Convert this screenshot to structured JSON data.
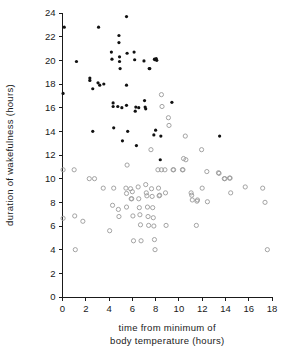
{
  "chart_data": {
    "type": "scatter",
    "title": "",
    "xlabel": "time from minimum of body temperature (hours)",
    "xlabel_lines": [
      "time from minimum of",
      "body temperature (hours)"
    ],
    "ylabel": "duration of wakefulness (hours)",
    "xlim": [
      0,
      18
    ],
    "ylim": [
      0,
      24
    ],
    "xticks": [
      0,
      2,
      4,
      6,
      8,
      10,
      12,
      14,
      16,
      18
    ],
    "yticks": [
      0,
      2,
      4,
      6,
      8,
      10,
      12,
      14,
      16,
      18,
      20,
      22,
      24
    ],
    "grid": false,
    "legend": "none",
    "series": [
      {
        "name": "filled-circles",
        "marker": "filled circle",
        "color": "#111111",
        "points": [
          [
            0.15,
            22.8
          ],
          [
            0.05,
            17.2
          ],
          [
            1.2,
            19.9
          ],
          [
            2.35,
            18.5
          ],
          [
            2.35,
            18.3
          ],
          [
            2.6,
            17.6
          ],
          [
            2.6,
            14.0
          ],
          [
            3.1,
            22.8
          ],
          [
            3.05,
            18.1
          ],
          [
            3.2,
            17.9
          ],
          [
            3.55,
            18.0
          ],
          [
            4.2,
            20.7
          ],
          [
            4.25,
            20.1
          ],
          [
            4.35,
            16.1
          ],
          [
            4.35,
            16.4
          ],
          [
            4.4,
            14.3
          ],
          [
            4.85,
            21.5
          ],
          [
            4.85,
            22.1
          ],
          [
            4.9,
            20.3
          ],
          [
            4.9,
            19.9
          ],
          [
            4.95,
            19.3
          ],
          [
            4.75,
            16.1
          ],
          [
            5.1,
            16.0
          ],
          [
            5.15,
            13.2
          ],
          [
            5.5,
            23.7
          ],
          [
            5.55,
            20.6
          ],
          [
            5.5,
            17.9
          ],
          [
            5.5,
            16.2
          ],
          [
            5.6,
            14.0
          ],
          [
            6.15,
            20.7
          ],
          [
            6.2,
            20.05
          ],
          [
            6.25,
            15.7
          ],
          [
            6.3,
            16.05
          ],
          [
            6.35,
            12.8
          ],
          [
            6.55,
            16.0
          ],
          [
            7.0,
            19.95
          ],
          [
            7.05,
            16.6
          ],
          [
            7.1,
            16.05
          ],
          [
            7.15,
            15.9
          ],
          [
            7.45,
            19.3
          ],
          [
            7.5,
            19.3
          ],
          [
            7.9,
            20.1
          ],
          [
            7.95,
            20.05
          ],
          [
            8.05,
            20.15
          ],
          [
            8.1,
            20.0
          ],
          [
            7.85,
            13.7
          ],
          [
            8.0,
            14.1
          ],
          [
            8.4,
            11.6
          ],
          [
            8.45,
            13.6
          ],
          [
            9.4,
            16.45
          ],
          [
            13.5,
            13.6
          ]
        ]
      },
      {
        "name": "open-circles",
        "marker": "open circle",
        "color": "#9a9a9a",
        "points": [
          [
            0.05,
            10.75
          ],
          [
            0.05,
            6.65
          ],
          [
            1.0,
            10.75
          ],
          [
            1.05,
            6.85
          ],
          [
            1.1,
            4.0
          ],
          [
            1.75,
            6.4
          ],
          [
            2.3,
            10.0
          ],
          [
            2.75,
            10.0
          ],
          [
            3.5,
            9.2
          ],
          [
            4.05,
            5.6
          ],
          [
            4.3,
            7.75
          ],
          [
            4.4,
            9.2
          ],
          [
            4.8,
            7.4
          ],
          [
            4.85,
            6.8
          ],
          [
            5.45,
            9.2
          ],
          [
            5.5,
            8.75
          ],
          [
            5.5,
            7.6
          ],
          [
            5.55,
            11.15
          ],
          [
            5.85,
            9.15
          ],
          [
            5.9,
            8.3
          ],
          [
            5.95,
            8.3
          ],
          [
            6.0,
            8.9
          ],
          [
            6.05,
            6.85
          ],
          [
            6.1,
            4.75
          ],
          [
            6.5,
            9.3
          ],
          [
            6.55,
            8.3
          ],
          [
            6.6,
            7.55
          ],
          [
            6.65,
            6.95
          ],
          [
            6.7,
            6.1
          ],
          [
            6.75,
            4.75
          ],
          [
            7.15,
            9.5
          ],
          [
            7.2,
            8.8
          ],
          [
            7.25,
            8.55
          ],
          [
            7.3,
            7.6
          ],
          [
            7.35,
            6.8
          ],
          [
            7.4,
            6.05
          ],
          [
            7.6,
            12.45
          ],
          [
            7.65,
            9.15
          ],
          [
            7.7,
            8.5
          ],
          [
            7.75,
            7.55
          ],
          [
            7.8,
            6.7
          ],
          [
            7.85,
            6.0
          ],
          [
            7.9,
            4.85
          ],
          [
            7.95,
            4.0
          ],
          [
            8.2,
            10.75
          ],
          [
            8.25,
            9.2
          ],
          [
            8.3,
            8.55
          ],
          [
            8.35,
            8.6
          ],
          [
            8.5,
            10.75
          ],
          [
            8.55,
            16.1
          ],
          [
            8.5,
            17.1
          ],
          [
            8.8,
            10.75
          ],
          [
            8.85,
            8.8
          ],
          [
            8.9,
            6.05
          ],
          [
            9.1,
            15.15
          ],
          [
            9.15,
            14.5
          ],
          [
            9.5,
            10.75
          ],
          [
            9.55,
            10.75
          ],
          [
            10.3,
            10.75
          ],
          [
            10.35,
            10.75
          ],
          [
            10.4,
            11.7
          ],
          [
            10.55,
            13.6
          ],
          [
            10.6,
            11.6
          ],
          [
            11.05,
            8.8
          ],
          [
            11.1,
            8.6
          ],
          [
            11.15,
            8.2
          ],
          [
            11.5,
            6.05
          ],
          [
            11.55,
            8.1
          ],
          [
            11.6,
            8.2
          ],
          [
            11.95,
            12.45
          ],
          [
            12.0,
            9.2
          ],
          [
            12.4,
            10.6
          ],
          [
            12.45,
            8.05
          ],
          [
            13.4,
            10.5
          ],
          [
            13.45,
            10.45
          ],
          [
            13.9,
            10.0
          ],
          [
            13.95,
            10.0
          ],
          [
            14.35,
            10.05
          ],
          [
            14.4,
            10.05
          ],
          [
            14.45,
            8.8
          ],
          [
            15.7,
            9.3
          ],
          [
            17.2,
            9.2
          ],
          [
            17.4,
            8.0
          ],
          [
            17.6,
            4.0
          ]
        ]
      }
    ]
  },
  "axes": {
    "y_label_text": "duration of wakefulness  (hours)",
    "x_label_line1": "time from minimum of",
    "x_label_line2": "body temperature  (hours)",
    "x_tick_labels": [
      "0",
      "2",
      "4",
      "6",
      "8",
      "10",
      "12",
      "14",
      "16",
      "18"
    ],
    "y_tick_labels": [
      "0",
      "2",
      "4",
      "6",
      "8",
      "10",
      "12",
      "14",
      "16",
      "18",
      "20",
      "22",
      "24"
    ]
  },
  "style": {
    "filled_color": "#111111",
    "open_color": "#9a9a9a",
    "axis_color": "#1a1a1a",
    "background": "#ffffff"
  }
}
